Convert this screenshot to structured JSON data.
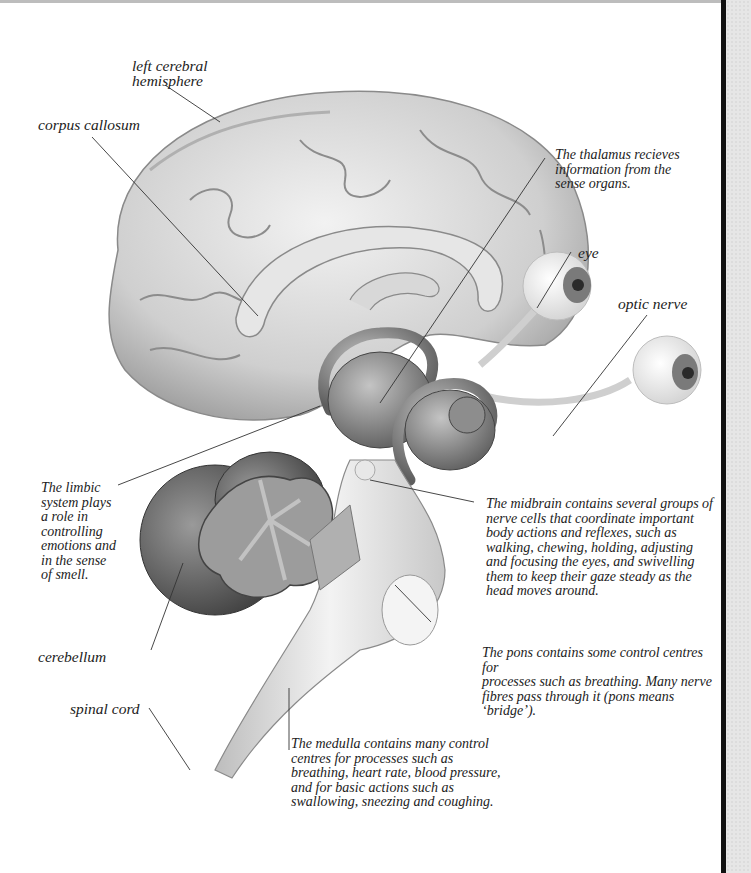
{
  "diagram": {
    "labels": {
      "left_cerebral_hemisphere": "left cerebral\nhemisphere",
      "corpus_callosum": "corpus callosum",
      "thalamus": "The thalamus recieves\ninformation from the\nsense organs.",
      "eye": "eye",
      "optic_nerve": "optic nerve",
      "limbic_system": "The limbic\nsystem plays\na role in\ncontrolling\nemotions and\nin the sense\nof smell.",
      "midbrain": "The midbrain contains several groups of\nnerve cells that coordinate important\nbody actions and reflexes, such as\nwalking, chewing, holding, adjusting\nand focusing the eyes, and swivelling\nthem to keep their gaze steady as the\nhead moves around.",
      "cerebellum": "cerebellum",
      "pons": "The pons contains some control centres for\nprocesses such as breathing. Many nerve\nfibres pass through it (pons means ‘bridge’).",
      "spinal_cord": "spinal cord",
      "medulla": "The medulla contains many control\ncentres for processes such as\nbreathing, heart rate, blood pressure,\nand for basic actions such as\nswallowing, sneezing and coughing."
    },
    "colors": {
      "cortex": "#d9d9d9",
      "cortex_dark": "#9a9a9a",
      "limbic": "#8c8c8c",
      "cerebellum": "#6e6e6e",
      "stem": "#e4e4e4",
      "line": "#333333",
      "page_edge": "#111111",
      "margin": "#e6e6e6"
    }
  }
}
